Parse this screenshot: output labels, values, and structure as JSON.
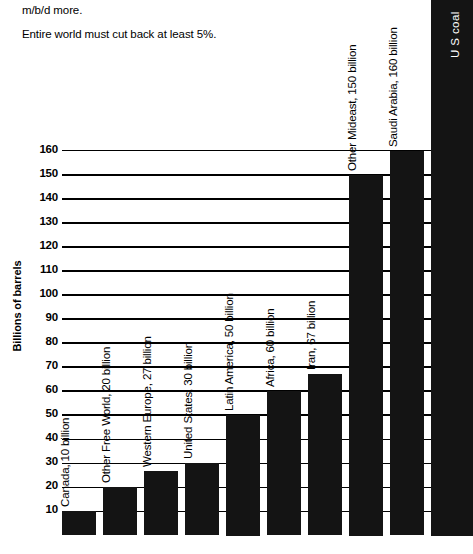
{
  "caption": {
    "line1_clipped": "average... p... y... ,",
    "line2": "m/b/d more.",
    "line3": "Entire world must cut back at least 5%."
  },
  "chart_data": {
    "type": "bar",
    "title": "",
    "xlabel": "",
    "ylabel": "Billions of barrels",
    "ylim": [
      0,
      170
    ],
    "grid": true,
    "legend": "none",
    "tick_labels": [
      "10",
      "20",
      "30",
      "40",
      "50",
      "60",
      "70",
      "80",
      "90",
      "100",
      "110",
      "120",
      "130",
      "140",
      "150",
      "160"
    ],
    "tick_values": [
      10,
      20,
      30,
      40,
      50,
      60,
      70,
      80,
      90,
      100,
      110,
      120,
      130,
      140,
      150,
      160
    ],
    "categories": [
      "Canada",
      "Other Free World",
      "Western Europe",
      "United States",
      "Latin America",
      "Africa",
      "Iran",
      "Other Mideast",
      "Saudi Arabia",
      "U S coal"
    ],
    "values": [
      10,
      20,
      27,
      30,
      50,
      60,
      67,
      150,
      160,
      260
    ],
    "bar_labels": [
      "Canada, 10 billion",
      "Other Free World, 20 billion",
      "Western Europe, 27 billion",
      "United States, 30 billion",
      "Latin America, 50 billion",
      "Africa, 60 billion",
      "Iran, 67 billion",
      "Other Mideast, 150 billion",
      "Saudi Arabia, 160 billion",
      "U S coal"
    ],
    "colors": {
      "bar": "#141414",
      "axis": "#000000",
      "background": "#ffffff"
    }
  }
}
